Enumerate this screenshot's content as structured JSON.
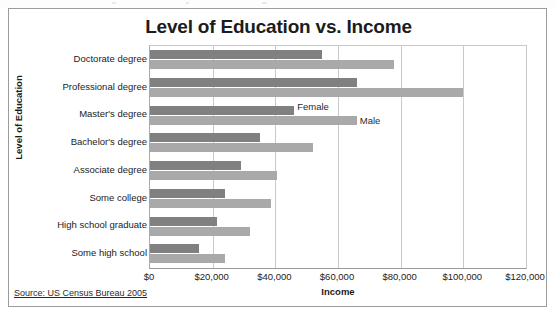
{
  "chart": {
    "title": "Level of Education vs. Income",
    "source_note": "Source: US Census Bureau 2005"
  },
  "colors": {
    "female_bar": "#808080",
    "male_bar": "#a9a9a9",
    "gridline": "#c9c9c9",
    "frame_border": "#9c9c9c",
    "text": "#222222"
  },
  "chart_data": {
    "type": "bar",
    "orientation": "horizontal",
    "title": "Level of Education vs. Income",
    "xlabel": "Income",
    "ylabel": "Level of Education",
    "xlim": [
      0,
      120000
    ],
    "xtick_values": [
      0,
      20000,
      40000,
      60000,
      80000,
      100000,
      120000
    ],
    "xtick_labels": [
      "$0",
      "$20,000",
      "$40,000",
      "$60,000",
      "$80,000",
      "$100,000",
      "$120,000"
    ],
    "grid": "vertical",
    "legend_position": "none",
    "annotations": [
      "Female",
      "Male"
    ],
    "categories": [
      "Doctorate degree",
      "Professional degree",
      "Master's degree",
      "Bachelor's degree",
      "Associate degree",
      "Some college",
      "High school graduate",
      "Some high school"
    ],
    "series": [
      {
        "name": "Female",
        "values": [
          55000,
          66000,
          46000,
          35000,
          29000,
          24000,
          21500,
          15500
        ]
      },
      {
        "name": "Male",
        "values": [
          78000,
          100000,
          66000,
          52000,
          40500,
          38500,
          32000,
          24000
        ]
      }
    ]
  }
}
